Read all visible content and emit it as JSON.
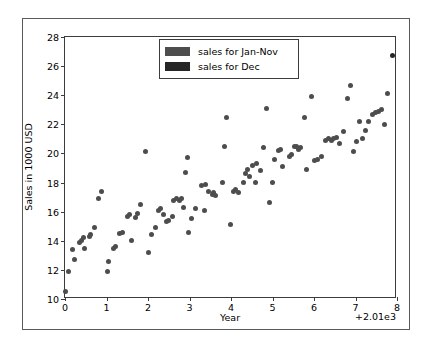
{
  "chart_data": {
    "type": "scatter",
    "title": "",
    "xlabel": "Year",
    "ylabel": "Sales in 1000 USD",
    "xlim": [
      0,
      8
    ],
    "ylim": [
      10,
      28
    ],
    "xticks": [
      "0",
      "1",
      "2",
      "3",
      "4",
      "5",
      "6",
      "7",
      "8"
    ],
    "yticks": [
      "10",
      "12",
      "14",
      "16",
      "18",
      "20",
      "22",
      "24",
      "26",
      "28"
    ],
    "x_offset_text": "+2.01e3",
    "grid": false,
    "legend_position": "upper center",
    "series": [
      {
        "name": "sales for Jan-Nov",
        "color": "#4d4d4d",
        "points": [
          [
            0.02,
            10.5
          ],
          [
            0.08,
            11.9
          ],
          [
            0.18,
            13.4
          ],
          [
            0.22,
            12.7
          ],
          [
            0.35,
            13.9
          ],
          [
            0.4,
            14.0
          ],
          [
            0.45,
            14.2
          ],
          [
            0.48,
            13.5
          ],
          [
            0.58,
            14.3
          ],
          [
            0.62,
            14.4
          ],
          [
            0.7,
            14.9
          ],
          [
            0.8,
            16.9
          ],
          [
            0.88,
            17.4
          ],
          [
            1.02,
            11.9
          ],
          [
            1.05,
            12.6
          ],
          [
            1.18,
            13.5
          ],
          [
            1.22,
            13.6
          ],
          [
            1.32,
            14.5
          ],
          [
            1.38,
            14.6
          ],
          [
            1.5,
            15.7
          ],
          [
            1.55,
            15.8
          ],
          [
            1.6,
            14.0
          ],
          [
            1.7,
            15.6
          ],
          [
            1.75,
            15.9
          ],
          [
            1.82,
            16.5
          ],
          [
            1.95,
            20.1
          ],
          [
            2.0,
            13.2
          ],
          [
            2.08,
            14.4
          ],
          [
            2.18,
            14.9
          ],
          [
            2.25,
            16.1
          ],
          [
            2.3,
            16.2
          ],
          [
            2.38,
            15.8
          ],
          [
            2.45,
            15.3
          ],
          [
            2.5,
            15.4
          ],
          [
            2.58,
            15.7
          ],
          [
            2.62,
            16.8
          ],
          [
            2.68,
            16.9
          ],
          [
            2.75,
            16.8
          ],
          [
            2.8,
            16.9
          ],
          [
            2.85,
            16.3
          ],
          [
            2.9,
            18.7
          ],
          [
            2.95,
            19.7
          ],
          [
            2.98,
            14.6
          ],
          [
            3.05,
            15.5
          ],
          [
            3.15,
            16.2
          ],
          [
            3.35,
            16.1
          ],
          [
            3.3,
            17.8
          ],
          [
            3.38,
            17.9
          ],
          [
            3.45,
            17.4
          ],
          [
            3.55,
            17.2
          ],
          [
            3.58,
            17.3
          ],
          [
            3.62,
            17.1
          ],
          [
            3.8,
            18.0
          ],
          [
            3.85,
            20.5
          ],
          [
            3.88,
            22.5
          ],
          [
            3.98,
            15.1
          ],
          [
            4.05,
            17.4
          ],
          [
            4.12,
            17.5
          ],
          [
            4.18,
            17.3
          ],
          [
            4.3,
            18.0
          ],
          [
            4.35,
            18.6
          ],
          [
            4.4,
            18.9
          ],
          [
            4.45,
            18.4
          ],
          [
            4.52,
            19.2
          ],
          [
            4.58,
            18.0
          ],
          [
            4.62,
            19.3
          ],
          [
            4.7,
            18.8
          ],
          [
            4.78,
            20.4
          ],
          [
            4.85,
            23.1
          ],
          [
            4.92,
            16.6
          ],
          [
            5.0,
            18.0
          ],
          [
            5.05,
            19.6
          ],
          [
            5.15,
            20.2
          ],
          [
            5.2,
            20.3
          ],
          [
            5.25,
            19.1
          ],
          [
            5.4,
            19.8
          ],
          [
            5.45,
            19.9
          ],
          [
            5.52,
            20.5
          ],
          [
            5.58,
            20.5
          ],
          [
            5.62,
            20.3
          ],
          [
            5.68,
            20.4
          ],
          [
            5.78,
            22.5
          ],
          [
            5.82,
            18.9
          ],
          [
            5.95,
            23.9
          ],
          [
            6.02,
            19.5
          ],
          [
            6.08,
            19.6
          ],
          [
            6.18,
            19.8
          ],
          [
            6.28,
            20.9
          ],
          [
            6.35,
            21.0
          ],
          [
            6.42,
            20.9
          ],
          [
            6.48,
            21.0
          ],
          [
            6.55,
            21.1
          ],
          [
            6.62,
            20.7
          ],
          [
            6.72,
            21.5
          ],
          [
            6.8,
            23.8
          ],
          [
            6.88,
            24.7
          ],
          [
            6.95,
            20.1
          ],
          [
            7.02,
            20.8
          ],
          [
            7.1,
            22.2
          ],
          [
            7.18,
            21.0
          ],
          [
            7.25,
            21.6
          ],
          [
            7.32,
            22.2
          ],
          [
            7.42,
            22.7
          ],
          [
            7.48,
            22.8
          ],
          [
            7.55,
            22.9
          ],
          [
            7.62,
            23.0
          ],
          [
            7.7,
            22.0
          ],
          [
            7.78,
            24.1
          ]
        ]
      },
      {
        "name": "sales for Dec",
        "color": "#262626",
        "points": [
          [
            7.9,
            26.7
          ]
        ]
      }
    ]
  },
  "legend": {
    "items": [
      {
        "label": "sales for Jan-Nov",
        "color": "#4d4d4d"
      },
      {
        "label": "sales for Dec",
        "color": "#262626"
      }
    ]
  },
  "axes": {
    "xlabel": "Year",
    "ylabel": "Sales in 1000 USD",
    "x_offset_text": "+2.01e3"
  }
}
